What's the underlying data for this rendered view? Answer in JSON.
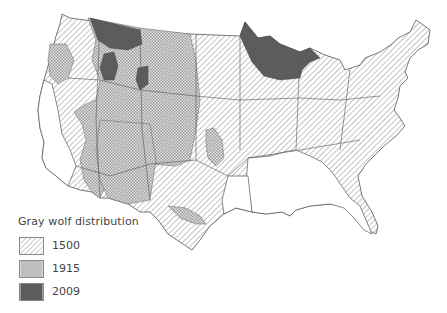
{
  "map": {
    "title": "Gray wolf distribution",
    "region": "Contiguous United States",
    "colors": {
      "background": "#ffffff",
      "outline": "#555555",
      "hatch_line": "#8a8a8a",
      "crosshatch": "#9a9a9a",
      "dark_fill": "#5c5c5c"
    }
  },
  "legend": {
    "title": "Gray wolf distribution",
    "items": [
      {
        "label": "1500",
        "pattern": "diagonal-hatch"
      },
      {
        "label": "1915",
        "pattern": "crosshatch"
      },
      {
        "label": "2009",
        "pattern": "solid-dark"
      }
    ]
  }
}
